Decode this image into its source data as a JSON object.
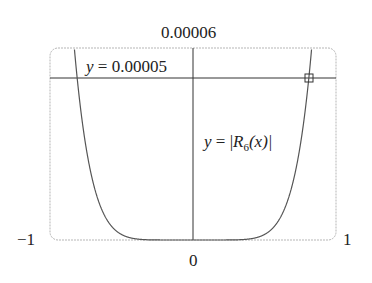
{
  "chart_data": {
    "type": "line",
    "title": "",
    "xlabel": "",
    "ylabel": "",
    "xlim": [
      -1,
      1
    ],
    "ylim": [
      0,
      6e-05
    ],
    "x_tick_labels": [
      "-1",
      "0",
      "1"
    ],
    "y_tick_labels": [
      "0.00006"
    ],
    "grid": false,
    "series": [
      {
        "name": "y = |R_6(x)|",
        "x": [
          -1.0,
          -0.9,
          -0.81,
          -0.7,
          -0.6,
          -0.5,
          -0.4,
          -0.3,
          0.0,
          0.3,
          0.4,
          0.5,
          0.6,
          0.7,
          0.81,
          0.9,
          1.0
        ],
        "values": [
          0.000218,
          0.000104,
          5e-05,
          1.8e-05,
          6.1e-06,
          1.7e-06,
          3.6e-07,
          5e-08,
          0.0,
          5e-08,
          3.6e-07,
          1.7e-06,
          6.1e-06,
          1.8e-05,
          5e-05,
          0.000104,
          0.000218
        ]
      },
      {
        "name": "y = 0.00005",
        "x": [
          -1,
          1
        ],
        "values": [
          5e-05,
          5e-05
        ]
      }
    ],
    "annotations": [
      {
        "text": "y = 0.00005",
        "position": "upper-left, above horizontal line"
      },
      {
        "text": "y = |R6(x)|",
        "position": "right of y-axis, mid-height"
      },
      {
        "text": "intersection marker (square)",
        "x": 0.81,
        "y": 5e-05
      }
    ],
    "legend": "none"
  },
  "labels": {
    "y_top": "0.00006",
    "x_left": "−1",
    "x_right": "1",
    "x_zero": "0",
    "hline_label_var": "y",
    "hline_label_eq": " = 0.00005",
    "curve_label_var": "y",
    "curve_label_eq": " = |",
    "curve_label_R": "R",
    "curve_label_sub": "6",
    "curve_label_tail": "(x)|"
  }
}
